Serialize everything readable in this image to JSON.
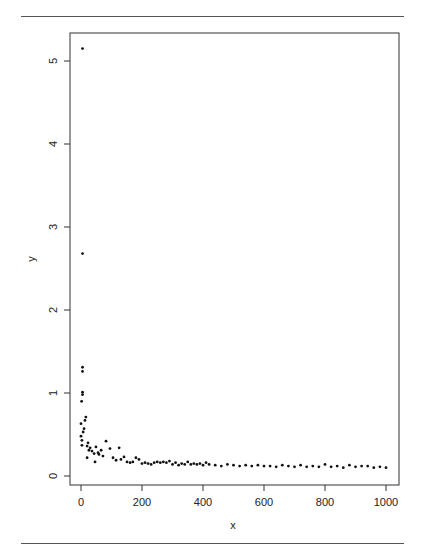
{
  "chart_data": {
    "type": "scatter",
    "title": "",
    "xlabel": "x",
    "ylabel": "y",
    "xlim": [
      -25,
      1040
    ],
    "ylim": [
      -0.1,
      5.3
    ],
    "x_ticks": [
      0,
      200,
      400,
      600,
      800,
      1000
    ],
    "y_ticks": [
      0,
      1,
      2,
      3,
      4,
      5
    ],
    "grid": false,
    "legend": null,
    "points": [
      {
        "x": 5,
        "y": 5.15
      },
      {
        "x": 5,
        "y": 2.68
      },
      {
        "x": 5,
        "y": 1.31
      },
      {
        "x": 5,
        "y": 1.26
      },
      {
        "x": 5,
        "y": 1.01
      },
      {
        "x": 5,
        "y": 0.98
      },
      {
        "x": 2,
        "y": 0.9
      },
      {
        "x": 16,
        "y": 0.71
      },
      {
        "x": 13,
        "y": 0.67
      },
      {
        "x": 0,
        "y": 0.63
      },
      {
        "x": 10,
        "y": 0.57
      },
      {
        "x": 7,
        "y": 0.53
      },
      {
        "x": 0,
        "y": 0.48
      },
      {
        "x": 3,
        "y": 0.43
      },
      {
        "x": 23,
        "y": 0.4
      },
      {
        "x": 3,
        "y": 0.37
      },
      {
        "x": 20,
        "y": 0.36
      },
      {
        "x": 30,
        "y": 0.34
      },
      {
        "x": 49,
        "y": 0.35
      },
      {
        "x": 26,
        "y": 0.31
      },
      {
        "x": 36,
        "y": 0.3
      },
      {
        "x": 66,
        "y": 0.31
      },
      {
        "x": 43,
        "y": 0.27
      },
      {
        "x": 56,
        "y": 0.28
      },
      {
        "x": 59,
        "y": 0.26
      },
      {
        "x": 72,
        "y": 0.24
      },
      {
        "x": 20,
        "y": 0.22
      },
      {
        "x": 82,
        "y": 0.42
      },
      {
        "x": 46,
        "y": 0.17
      },
      {
        "x": 95,
        "y": 0.33
      },
      {
        "x": 105,
        "y": 0.22
      },
      {
        "x": 115,
        "y": 0.19
      },
      {
        "x": 125,
        "y": 0.34
      },
      {
        "x": 131,
        "y": 0.2
      },
      {
        "x": 141,
        "y": 0.23
      },
      {
        "x": 151,
        "y": 0.17
      },
      {
        "x": 161,
        "y": 0.16
      },
      {
        "x": 170,
        "y": 0.17
      },
      {
        "x": 180,
        "y": 0.22
      },
      {
        "x": 190,
        "y": 0.2
      },
      {
        "x": 200,
        "y": 0.15
      },
      {
        "x": 210,
        "y": 0.16
      },
      {
        "x": 220,
        "y": 0.15
      },
      {
        "x": 230,
        "y": 0.14
      },
      {
        "x": 240,
        "y": 0.16
      },
      {
        "x": 250,
        "y": 0.17
      },
      {
        "x": 260,
        "y": 0.16
      },
      {
        "x": 270,
        "y": 0.17
      },
      {
        "x": 280,
        "y": 0.16
      },
      {
        "x": 290,
        "y": 0.18
      },
      {
        "x": 300,
        "y": 0.14
      },
      {
        "x": 310,
        "y": 0.16
      },
      {
        "x": 320,
        "y": 0.13
      },
      {
        "x": 330,
        "y": 0.15
      },
      {
        "x": 340,
        "y": 0.14
      },
      {
        "x": 350,
        "y": 0.17
      },
      {
        "x": 360,
        "y": 0.14
      },
      {
        "x": 370,
        "y": 0.15
      },
      {
        "x": 380,
        "y": 0.14
      },
      {
        "x": 390,
        "y": 0.15
      },
      {
        "x": 400,
        "y": 0.13
      },
      {
        "x": 410,
        "y": 0.16
      },
      {
        "x": 420,
        "y": 0.14
      },
      {
        "x": 440,
        "y": 0.13
      },
      {
        "x": 460,
        "y": 0.12
      },
      {
        "x": 480,
        "y": 0.14
      },
      {
        "x": 500,
        "y": 0.13
      },
      {
        "x": 520,
        "y": 0.12
      },
      {
        "x": 540,
        "y": 0.13
      },
      {
        "x": 560,
        "y": 0.12
      },
      {
        "x": 580,
        "y": 0.13
      },
      {
        "x": 600,
        "y": 0.12
      },
      {
        "x": 620,
        "y": 0.12
      },
      {
        "x": 640,
        "y": 0.11
      },
      {
        "x": 660,
        "y": 0.13
      },
      {
        "x": 680,
        "y": 0.12
      },
      {
        "x": 700,
        "y": 0.11
      },
      {
        "x": 720,
        "y": 0.13
      },
      {
        "x": 740,
        "y": 0.11
      },
      {
        "x": 760,
        "y": 0.12
      },
      {
        "x": 780,
        "y": 0.11
      },
      {
        "x": 800,
        "y": 0.14
      },
      {
        "x": 820,
        "y": 0.11
      },
      {
        "x": 840,
        "y": 0.12
      },
      {
        "x": 860,
        "y": 0.1
      },
      {
        "x": 880,
        "y": 0.13
      },
      {
        "x": 900,
        "y": 0.11
      },
      {
        "x": 920,
        "y": 0.12
      },
      {
        "x": 940,
        "y": 0.12
      },
      {
        "x": 960,
        "y": 0.1
      },
      {
        "x": 980,
        "y": 0.11
      },
      {
        "x": 1000,
        "y": 0.1
      }
    ]
  },
  "layout": {
    "point_color": "#111111",
    "axis_color": "#333333",
    "rule_color": "#555555"
  }
}
